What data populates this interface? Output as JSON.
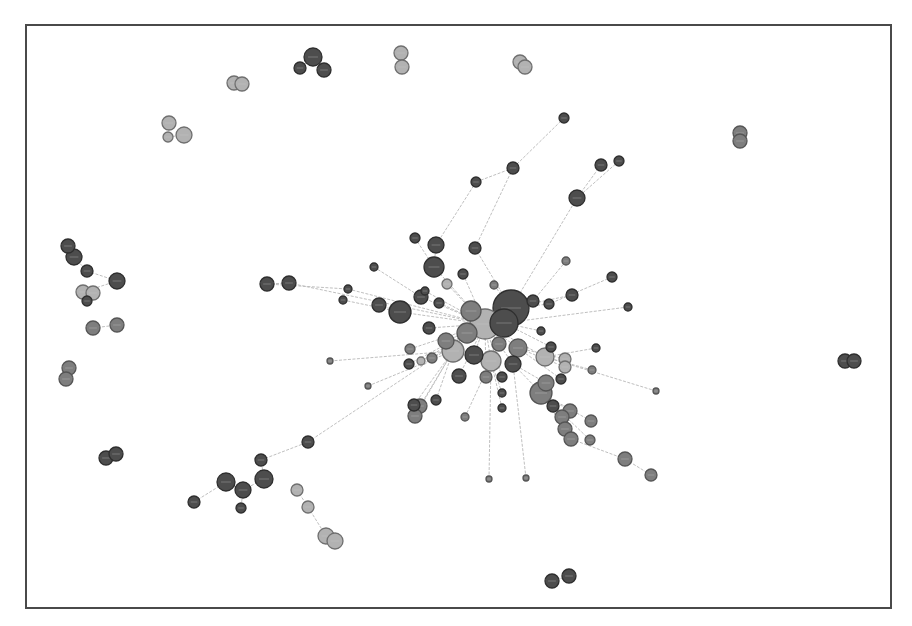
{
  "figure": {
    "type": "network-graph",
    "frame": {
      "x": 25,
      "y": 24,
      "width": 865,
      "height": 583
    },
    "colors": {
      "dark": "#4d4d4d",
      "mid": "#7e7e7e",
      "light": "#b2b2b2",
      "edge": "#b8b8b8",
      "border": "#4a4a4a"
    },
    "node_labels_legible": false
  },
  "nodes": [
    {
      "id": 0,
      "x": 312,
      "y": 56,
      "r": 9,
      "c": "dark"
    },
    {
      "id": 1,
      "x": 299,
      "y": 67,
      "r": 6,
      "c": "dark"
    },
    {
      "id": 2,
      "x": 323,
      "y": 69,
      "r": 7,
      "c": "dark"
    },
    {
      "id": 3,
      "x": 400,
      "y": 52,
      "r": 7,
      "c": "light"
    },
    {
      "id": 4,
      "x": 401,
      "y": 66,
      "r": 7,
      "c": "light"
    },
    {
      "id": 5,
      "x": 519,
      "y": 61,
      "r": 7,
      "c": "light"
    },
    {
      "id": 6,
      "x": 524,
      "y": 66,
      "r": 7,
      "c": "light"
    },
    {
      "id": 7,
      "x": 233,
      "y": 82,
      "r": 7,
      "c": "light"
    },
    {
      "id": 8,
      "x": 241,
      "y": 83,
      "r": 7,
      "c": "light"
    },
    {
      "id": 9,
      "x": 168,
      "y": 122,
      "r": 7,
      "c": "light"
    },
    {
      "id": 10,
      "x": 167,
      "y": 136,
      "r": 5,
      "c": "light"
    },
    {
      "id": 11,
      "x": 183,
      "y": 134,
      "r": 8,
      "c": "light"
    },
    {
      "id": 12,
      "x": 739,
      "y": 132,
      "r": 7,
      "c": "mid"
    },
    {
      "id": 13,
      "x": 739,
      "y": 140,
      "r": 7,
      "c": "mid"
    },
    {
      "id": 14,
      "x": 67,
      "y": 245,
      "r": 7,
      "c": "dark"
    },
    {
      "id": 15,
      "x": 73,
      "y": 256,
      "r": 8,
      "c": "dark"
    },
    {
      "id": 16,
      "x": 86,
      "y": 270,
      "r": 6,
      "c": "dark"
    },
    {
      "id": 17,
      "x": 116,
      "y": 280,
      "r": 8,
      "c": "dark"
    },
    {
      "id": 18,
      "x": 82,
      "y": 291,
      "r": 7,
      "c": "light"
    },
    {
      "id": 19,
      "x": 92,
      "y": 292,
      "r": 7,
      "c": "light"
    },
    {
      "id": 20,
      "x": 86,
      "y": 300,
      "r": 5,
      "c": "dark"
    },
    {
      "id": 21,
      "x": 92,
      "y": 327,
      "r": 7,
      "c": "mid"
    },
    {
      "id": 22,
      "x": 116,
      "y": 324,
      "r": 7,
      "c": "mid"
    },
    {
      "id": 23,
      "x": 68,
      "y": 367,
      "r": 7,
      "c": "mid"
    },
    {
      "id": 24,
      "x": 65,
      "y": 378,
      "r": 7,
      "c": "mid"
    },
    {
      "id": 25,
      "x": 266,
      "y": 283,
      "r": 7,
      "c": "dark"
    },
    {
      "id": 26,
      "x": 288,
      "y": 282,
      "r": 7,
      "c": "dark"
    },
    {
      "id": 27,
      "x": 844,
      "y": 360,
      "r": 7,
      "c": "dark"
    },
    {
      "id": 28,
      "x": 853,
      "y": 360,
      "r": 7,
      "c": "dark"
    },
    {
      "id": 29,
      "x": 105,
      "y": 457,
      "r": 7,
      "c": "dark"
    },
    {
      "id": 30,
      "x": 115,
      "y": 453,
      "r": 7,
      "c": "dark"
    },
    {
      "id": 31,
      "x": 225,
      "y": 481,
      "r": 9,
      "c": "dark"
    },
    {
      "id": 32,
      "x": 242,
      "y": 489,
      "r": 8,
      "c": "dark"
    },
    {
      "id": 33,
      "x": 263,
      "y": 478,
      "r": 9,
      "c": "dark"
    },
    {
      "id": 34,
      "x": 260,
      "y": 459,
      "r": 6,
      "c": "dark"
    },
    {
      "id": 35,
      "x": 307,
      "y": 441,
      "r": 6,
      "c": "dark"
    },
    {
      "id": 36,
      "x": 193,
      "y": 501,
      "r": 6,
      "c": "dark"
    },
    {
      "id": 37,
      "x": 240,
      "y": 507,
      "r": 5,
      "c": "dark"
    },
    {
      "id": 38,
      "x": 296,
      "y": 489,
      "r": 6,
      "c": "light"
    },
    {
      "id": 39,
      "x": 307,
      "y": 506,
      "r": 6,
      "c": "light"
    },
    {
      "id": 40,
      "x": 325,
      "y": 535,
      "r": 8,
      "c": "light"
    },
    {
      "id": 41,
      "x": 334,
      "y": 540,
      "r": 8,
      "c": "light"
    },
    {
      "id": 42,
      "x": 551,
      "y": 580,
      "r": 7,
      "c": "dark"
    },
    {
      "id": 43,
      "x": 568,
      "y": 575,
      "r": 7,
      "c": "dark"
    },
    {
      "id": 44,
      "x": 563,
      "y": 117,
      "r": 5,
      "c": "dark"
    },
    {
      "id": 45,
      "x": 512,
      "y": 167,
      "r": 6,
      "c": "dark"
    },
    {
      "id": 46,
      "x": 475,
      "y": 181,
      "r": 5,
      "c": "dark"
    },
    {
      "id": 47,
      "x": 600,
      "y": 164,
      "r": 6,
      "c": "dark"
    },
    {
      "id": 48,
      "x": 618,
      "y": 160,
      "r": 5,
      "c": "dark"
    },
    {
      "id": 49,
      "x": 576,
      "y": 197,
      "r": 8,
      "c": "dark"
    },
    {
      "id": 50,
      "x": 414,
      "y": 237,
      "r": 5,
      "c": "dark"
    },
    {
      "id": 51,
      "x": 435,
      "y": 244,
      "r": 8,
      "c": "dark"
    },
    {
      "id": 52,
      "x": 474,
      "y": 247,
      "r": 6,
      "c": "dark"
    },
    {
      "id": 53,
      "x": 433,
      "y": 266,
      "r": 10,
      "c": "dark"
    },
    {
      "id": 54,
      "x": 373,
      "y": 266,
      "r": 4,
      "c": "dark"
    },
    {
      "id": 55,
      "x": 462,
      "y": 273,
      "r": 5,
      "c": "dark"
    },
    {
      "id": 56,
      "x": 446,
      "y": 283,
      "r": 5,
      "c": "light"
    },
    {
      "id": 57,
      "x": 565,
      "y": 260,
      "r": 4,
      "c": "mid"
    },
    {
      "id": 58,
      "x": 611,
      "y": 276,
      "r": 5,
      "c": "dark"
    },
    {
      "id": 59,
      "x": 347,
      "y": 288,
      "r": 4,
      "c": "dark"
    },
    {
      "id": 60,
      "x": 342,
      "y": 299,
      "r": 4,
      "c": "dark"
    },
    {
      "id": 61,
      "x": 378,
      "y": 304,
      "r": 7,
      "c": "dark"
    },
    {
      "id": 62,
      "x": 399,
      "y": 311,
      "r": 11,
      "c": "dark"
    },
    {
      "id": 63,
      "x": 420,
      "y": 296,
      "r": 7,
      "c": "dark"
    },
    {
      "id": 64,
      "x": 438,
      "y": 302,
      "r": 5,
      "c": "dark"
    },
    {
      "id": 65,
      "x": 424,
      "y": 290,
      "r": 4,
      "c": "dark"
    },
    {
      "id": 66,
      "x": 493,
      "y": 284,
      "r": 4,
      "c": "mid"
    },
    {
      "id": 67,
      "x": 510,
      "y": 307,
      "r": 18,
      "c": "dark"
    },
    {
      "id": 68,
      "x": 503,
      "y": 322,
      "r": 14,
      "c": "dark"
    },
    {
      "id": 69,
      "x": 532,
      "y": 300,
      "r": 6,
      "c": "dark"
    },
    {
      "id": 70,
      "x": 548,
      "y": 303,
      "r": 5,
      "c": "dark"
    },
    {
      "id": 71,
      "x": 571,
      "y": 294,
      "r": 6,
      "c": "dark"
    },
    {
      "id": 72,
      "x": 627,
      "y": 306,
      "r": 4,
      "c": "dark"
    },
    {
      "id": 73,
      "x": 540,
      "y": 330,
      "r": 4,
      "c": "dark"
    },
    {
      "id": 74,
      "x": 484,
      "y": 323,
      "r": 15,
      "c": "light"
    },
    {
      "id": 75,
      "x": 470,
      "y": 310,
      "r": 10,
      "c": "mid"
    },
    {
      "id": 76,
      "x": 466,
      "y": 332,
      "r": 10,
      "c": "mid"
    },
    {
      "id": 77,
      "x": 428,
      "y": 327,
      "r": 6,
      "c": "dark"
    },
    {
      "id": 78,
      "x": 445,
      "y": 340,
      "r": 8,
      "c": "mid"
    },
    {
      "id": 79,
      "x": 452,
      "y": 350,
      "r": 11,
      "c": "light"
    },
    {
      "id": 80,
      "x": 473,
      "y": 354,
      "r": 9,
      "c": "dark"
    },
    {
      "id": 81,
      "x": 490,
      "y": 360,
      "r": 10,
      "c": "light"
    },
    {
      "id": 82,
      "x": 517,
      "y": 347,
      "r": 9,
      "c": "mid"
    },
    {
      "id": 83,
      "x": 512,
      "y": 363,
      "r": 8,
      "c": "dark"
    },
    {
      "id": 84,
      "x": 498,
      "y": 343,
      "r": 7,
      "c": "mid"
    },
    {
      "id": 85,
      "x": 544,
      "y": 356,
      "r": 9,
      "c": "light"
    },
    {
      "id": 86,
      "x": 550,
      "y": 346,
      "r": 5,
      "c": "dark"
    },
    {
      "id": 87,
      "x": 564,
      "y": 358,
      "r": 6,
      "c": "light"
    },
    {
      "id": 88,
      "x": 564,
      "y": 366,
      "r": 6,
      "c": "light"
    },
    {
      "id": 89,
      "x": 595,
      "y": 347,
      "r": 4,
      "c": "dark"
    },
    {
      "id": 90,
      "x": 591,
      "y": 369,
      "r": 4,
      "c": "mid"
    },
    {
      "id": 91,
      "x": 560,
      "y": 378,
      "r": 5,
      "c": "dark"
    },
    {
      "id": 92,
      "x": 655,
      "y": 390,
      "r": 3,
      "c": "mid"
    },
    {
      "id": 93,
      "x": 409,
      "y": 348,
      "r": 5,
      "c": "mid"
    },
    {
      "id": 94,
      "x": 408,
      "y": 363,
      "r": 5,
      "c": "dark"
    },
    {
      "id": 95,
      "x": 420,
      "y": 360,
      "r": 4,
      "c": "light"
    },
    {
      "id": 96,
      "x": 431,
      "y": 357,
      "r": 5,
      "c": "mid"
    },
    {
      "id": 97,
      "x": 458,
      "y": 375,
      "r": 7,
      "c": "dark"
    },
    {
      "id": 98,
      "x": 485,
      "y": 376,
      "r": 6,
      "c": "mid"
    },
    {
      "id": 99,
      "x": 501,
      "y": 376,
      "r": 5,
      "c": "dark"
    },
    {
      "id": 100,
      "x": 329,
      "y": 360,
      "r": 3,
      "c": "mid"
    },
    {
      "id": 101,
      "x": 367,
      "y": 385,
      "r": 3,
      "c": "mid"
    },
    {
      "id": 102,
      "x": 435,
      "y": 399,
      "r": 5,
      "c": "dark"
    },
    {
      "id": 103,
      "x": 413,
      "y": 404,
      "r": 6,
      "c": "dark"
    },
    {
      "id": 104,
      "x": 419,
      "y": 405,
      "r": 7,
      "c": "mid"
    },
    {
      "id": 105,
      "x": 414,
      "y": 415,
      "r": 7,
      "c": "mid"
    },
    {
      "id": 106,
      "x": 464,
      "y": 416,
      "r": 4,
      "c": "mid"
    },
    {
      "id": 107,
      "x": 501,
      "y": 392,
      "r": 4,
      "c": "dark"
    },
    {
      "id": 108,
      "x": 501,
      "y": 407,
      "r": 4,
      "c": "dark"
    },
    {
      "id": 109,
      "x": 540,
      "y": 392,
      "r": 11,
      "c": "mid"
    },
    {
      "id": 110,
      "x": 545,
      "y": 382,
      "r": 8,
      "c": "mid"
    },
    {
      "id": 111,
      "x": 552,
      "y": 405,
      "r": 6,
      "c": "dark"
    },
    {
      "id": 112,
      "x": 569,
      "y": 410,
      "r": 7,
      "c": "mid"
    },
    {
      "id": 113,
      "x": 561,
      "y": 416,
      "r": 7,
      "c": "mid"
    },
    {
      "id": 114,
      "x": 564,
      "y": 428,
      "r": 7,
      "c": "mid"
    },
    {
      "id": 115,
      "x": 570,
      "y": 438,
      "r": 7,
      "c": "mid"
    },
    {
      "id": 116,
      "x": 590,
      "y": 420,
      "r": 6,
      "c": "mid"
    },
    {
      "id": 117,
      "x": 589,
      "y": 439,
      "r": 5,
      "c": "mid"
    },
    {
      "id": 118,
      "x": 624,
      "y": 458,
      "r": 7,
      "c": "mid"
    },
    {
      "id": 119,
      "x": 650,
      "y": 474,
      "r": 6,
      "c": "mid"
    },
    {
      "id": 120,
      "x": 488,
      "y": 478,
      "r": 3,
      "c": "mid"
    },
    {
      "id": 121,
      "x": 525,
      "y": 477,
      "r": 3,
      "c": "mid"
    }
  ],
  "edges": [
    [
      0,
      1
    ],
    [
      0,
      2
    ],
    [
      3,
      4
    ],
    [
      5,
      6
    ],
    [
      7,
      8
    ],
    [
      9,
      10
    ],
    [
      10,
      11
    ],
    [
      12,
      13
    ],
    [
      14,
      15
    ],
    [
      15,
      16
    ],
    [
      16,
      17
    ],
    [
      17,
      18
    ],
    [
      18,
      19
    ],
    [
      19,
      20
    ],
    [
      21,
      22
    ],
    [
      23,
      24
    ],
    [
      25,
      26
    ],
    [
      27,
      28
    ],
    [
      29,
      30
    ],
    [
      31,
      32
    ],
    [
      32,
      33
    ],
    [
      33,
      34
    ],
    [
      34,
      35
    ],
    [
      36,
      31
    ],
    [
      32,
      37
    ],
    [
      38,
      39
    ],
    [
      39,
      40
    ],
    [
      40,
      41
    ],
    [
      42,
      43
    ],
    [
      35,
      74
    ],
    [
      44,
      45
    ],
    [
      45,
      46
    ],
    [
      46,
      51
    ],
    [
      45,
      52
    ],
    [
      47,
      49
    ],
    [
      48,
      49
    ],
    [
      49,
      67
    ],
    [
      50,
      53
    ],
    [
      51,
      53
    ],
    [
      52,
      67
    ],
    [
      53,
      74
    ],
    [
      54,
      63
    ],
    [
      55,
      74
    ],
    [
      56,
      74
    ],
    [
      57,
      69
    ],
    [
      58,
      70
    ],
    [
      59,
      74
    ],
    [
      60,
      62
    ],
    [
      61,
      62
    ],
    [
      62,
      74
    ],
    [
      63,
      74
    ],
    [
      64,
      74
    ],
    [
      65,
      74
    ],
    [
      66,
      67
    ],
    [
      67,
      74
    ],
    [
      68,
      74
    ],
    [
      69,
      67
    ],
    [
      70,
      67
    ],
    [
      71,
      67
    ],
    [
      72,
      68
    ],
    [
      73,
      68
    ],
    [
      75,
      74
    ],
    [
      76,
      74
    ],
    [
      77,
      74
    ],
    [
      78,
      74
    ],
    [
      79,
      74
    ],
    [
      80,
      74
    ],
    [
      81,
      74
    ],
    [
      82,
      74
    ],
    [
      83,
      74
    ],
    [
      84,
      74
    ],
    [
      85,
      74
    ],
    [
      86,
      68
    ],
    [
      87,
      82
    ],
    [
      88,
      82
    ],
    [
      89,
      85
    ],
    [
      90,
      85
    ],
    [
      91,
      82
    ],
    [
      92,
      85
    ],
    [
      93,
      74
    ],
    [
      94,
      74
    ],
    [
      95,
      74
    ],
    [
      96,
      74
    ],
    [
      97,
      74
    ],
    [
      98,
      74
    ],
    [
      99,
      74
    ],
    [
      100,
      79
    ],
    [
      101,
      79
    ],
    [
      102,
      79
    ],
    [
      103,
      79
    ],
    [
      104,
      79
    ],
    [
      105,
      79
    ],
    [
      106,
      81
    ],
    [
      107,
      81
    ],
    [
      108,
      81
    ],
    [
      109,
      83
    ],
    [
      110,
      83
    ],
    [
      111,
      109
    ],
    [
      112,
      109
    ],
    [
      113,
      109
    ],
    [
      114,
      109
    ],
    [
      115,
      109
    ],
    [
      116,
      109
    ],
    [
      117,
      109
    ],
    [
      118,
      115
    ],
    [
      119,
      118
    ],
    [
      120,
      81
    ],
    [
      121,
      83
    ],
    [
      26,
      74
    ],
    [
      25,
      59
    ]
  ]
}
